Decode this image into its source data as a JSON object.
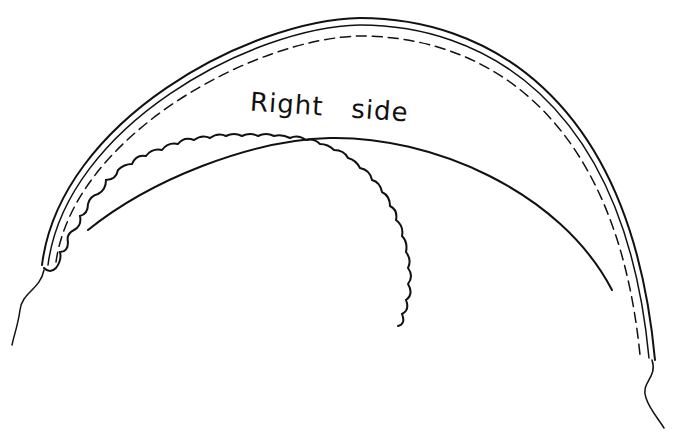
{
  "diagram": {
    "label_word1": "Right",
    "label_word2": "side",
    "stroke_color": "#111111",
    "background": "#ffffff"
  }
}
